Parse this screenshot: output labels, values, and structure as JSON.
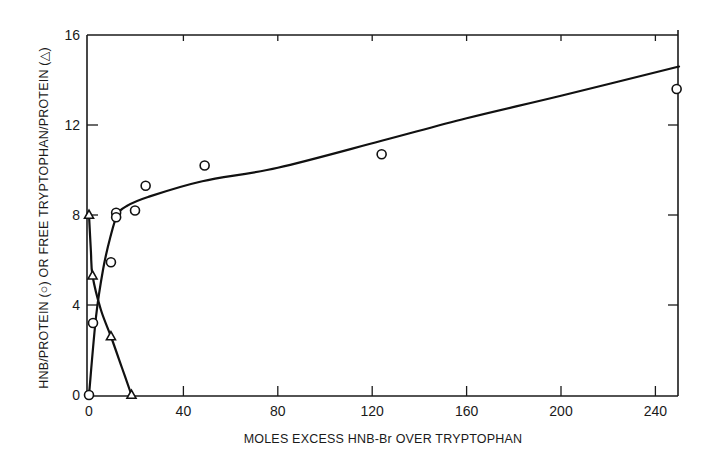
{
  "chart_data": {
    "type": "line",
    "title": "",
    "xlabel": "MOLES EXCESS  HNB-Br OVER TRYPTOPHAN",
    "ylabel": "HNB/PROTEIN (○)  OR FREE TRYPTOPHAN/PROTEIN (△)",
    "xlim": [
      0,
      250
    ],
    "ylim": [
      0,
      16
    ],
    "x_ticks": [
      0,
      40,
      80,
      120,
      160,
      200,
      240
    ],
    "y_ticks": [
      0,
      4,
      8,
      12,
      16
    ],
    "grid": false,
    "legend": "none (symbols identified in y-axis label)",
    "series": [
      {
        "name": "HNB/PROTEIN",
        "marker": "circle",
        "points": [
          {
            "x": 0,
            "y": 0
          },
          {
            "x": 1.7,
            "y": 3.2
          },
          {
            "x": 9.3,
            "y": 5.9
          },
          {
            "x": 11.5,
            "y": 8.1
          },
          {
            "x": 11.5,
            "y": 7.9
          },
          {
            "x": 19.5,
            "y": 8.2
          },
          {
            "x": 24,
            "y": 9.3
          },
          {
            "x": 49,
            "y": 10.2
          },
          {
            "x": 124,
            "y": 10.7
          },
          {
            "x": 249,
            "y": 13.6
          }
        ],
        "fit_curve": [
          {
            "x": 0,
            "y": 0
          },
          {
            "x": 3,
            "y": 3.5
          },
          {
            "x": 6,
            "y": 5.6
          },
          {
            "x": 9,
            "y": 7.0
          },
          {
            "x": 12,
            "y": 8.0
          },
          {
            "x": 16,
            "y": 8.4
          },
          {
            "x": 25,
            "y": 8.8
          },
          {
            "x": 48,
            "y": 9.5
          },
          {
            "x": 80,
            "y": 10.1
          },
          {
            "x": 124,
            "y": 11.3
          },
          {
            "x": 160,
            "y": 12.3
          },
          {
            "x": 200,
            "y": 13.3
          },
          {
            "x": 250,
            "y": 14.6
          }
        ]
      },
      {
        "name": "FREE TRYPTOPHAN/PROTEIN",
        "marker": "triangle",
        "points": [
          {
            "x": 0,
            "y": 8.0
          },
          {
            "x": 1.5,
            "y": 5.3
          },
          {
            "x": 9.3,
            "y": 2.6
          },
          {
            "x": 18,
            "y": 0
          }
        ],
        "fit_curve": [
          {
            "x": 0,
            "y": 8.0
          },
          {
            "x": 0.8,
            "y": 6.4
          },
          {
            "x": 1.5,
            "y": 5.3
          },
          {
            "x": 5,
            "y": 3.8
          },
          {
            "x": 9.3,
            "y": 2.6
          },
          {
            "x": 14,
            "y": 1.2
          },
          {
            "x": 18,
            "y": 0
          }
        ]
      }
    ]
  },
  "axes": {
    "x_tick_labels": [
      "0",
      "40",
      "80",
      "120",
      "160",
      "200",
      "240"
    ],
    "y_tick_labels": [
      "0",
      "4",
      "8",
      "12",
      "16"
    ],
    "x_title": "MOLES EXCESS  HNB-Br OVER TRYPTOPHAN",
    "y_title": "HNB/PROTEIN (○)  OR FREE TRYPTOPHAN/PROTEIN (△)"
  },
  "colors": {
    "ink": "#111111",
    "background": "#ffffff"
  }
}
